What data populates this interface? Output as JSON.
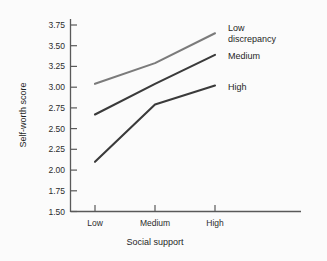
{
  "chart_data": {
    "type": "line",
    "title": "",
    "xlabel": "Social support",
    "ylabel": "Self-worth score",
    "categories": [
      "Low",
      "Medium",
      "High"
    ],
    "ylim": [
      1.5,
      3.75
    ],
    "ytick_labels": [
      "1.50",
      "1.75",
      "2.00",
      "2.25",
      "2.50",
      "2.75",
      "3.00",
      "3.25",
      "3.50",
      "3.75"
    ],
    "ytick_values": [
      1.5,
      1.75,
      2.0,
      2.25,
      2.5,
      2.75,
      3.0,
      3.25,
      3.5,
      3.75
    ],
    "grid": false,
    "legend_position": "right-inline",
    "series": [
      {
        "name": "Low discrepancy",
        "label_lines": [
          "Low",
          "discrepancy"
        ],
        "color": "#7b7b7b",
        "values": [
          3.04,
          3.29,
          3.65
        ]
      },
      {
        "name": "Medium",
        "label_lines": [
          "Medium"
        ],
        "color": "#3a3a3a",
        "values": [
          2.67,
          3.04,
          3.39
        ]
      },
      {
        "name": "High",
        "label_lines": [
          "High"
        ],
        "color": "#3a3a3a",
        "values": [
          2.1,
          2.79,
          3.02
        ]
      }
    ]
  },
  "axes": {
    "x_label": "Social support",
    "y_label": "Self-worth score",
    "y_ticks": [
      {
        "label": "3.75"
      },
      {
        "label": "3.50"
      },
      {
        "label": "3.25"
      },
      {
        "label": "3.00"
      },
      {
        "label": "2.75"
      },
      {
        "label": "2.50"
      },
      {
        "label": "2.25"
      },
      {
        "label": "2.00"
      },
      {
        "label": "1.75"
      },
      {
        "label": "1.50"
      }
    ],
    "x_ticks": [
      {
        "label": "Low"
      },
      {
        "label": "Medium"
      },
      {
        "label": "High"
      }
    ]
  },
  "legend": {
    "low_line1": "Low",
    "low_line2": "discrepancy",
    "medium": "Medium",
    "high": "High"
  },
  "colors": {
    "light_line": "#7b7b7b",
    "dark_line": "#3a3a3a",
    "axis": "#595959",
    "text": "#1f1f1f",
    "background": "#fbfbfb"
  }
}
